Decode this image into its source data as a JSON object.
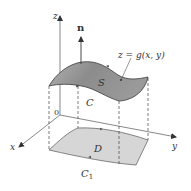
{
  "figure": {
    "labels": {
      "z_axis": "z",
      "x_axis": "x",
      "y_axis": "y",
      "origin": "0",
      "normal": "n",
      "surface": "S",
      "surface_equation": "z = g(x, y)",
      "boundary_curve": "C",
      "region": "D",
      "region_boundary": "C",
      "region_boundary_subscript": "1"
    },
    "colors": {
      "surface_fill": "#8a8a8a",
      "surface_fill_light": "#b5b5b5",
      "region_fill": "#d6d6d6",
      "axis": "#555555",
      "dashed": "#444444",
      "text": "#333333"
    }
  }
}
